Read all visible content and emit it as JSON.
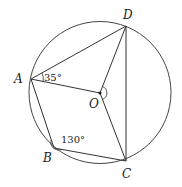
{
  "figure": {
    "type": "circle-geometry",
    "circle": {
      "center": "O",
      "cx": 100,
      "cy": 92.5,
      "r": 71
    },
    "points": [
      {
        "name": "A",
        "x": 31,
        "y": 79,
        "label": "A",
        "lx": 14,
        "ly": 83
      },
      {
        "name": "B",
        "x": 54,
        "y": 148,
        "label": "B",
        "lx": 43,
        "ly": 162
      },
      {
        "name": "C",
        "x": 126,
        "y": 161,
        "label": "C",
        "lx": 122,
        "ly": 178
      },
      {
        "name": "D",
        "x": 126,
        "y": 26,
        "label": "D",
        "lx": 123,
        "ly": 19
      },
      {
        "name": "O",
        "x": 100,
        "y": 93,
        "label": "O",
        "lx": 89,
        "ly": 108
      }
    ],
    "segments": [
      [
        "A",
        "D"
      ],
      [
        "A",
        "O"
      ],
      [
        "A",
        "B"
      ],
      [
        "B",
        "C"
      ],
      [
        "O",
        "D"
      ],
      [
        "O",
        "C"
      ],
      [
        "D",
        "C"
      ]
    ],
    "angles": [
      {
        "vertex": "A",
        "value": "35°",
        "label": "35°"
      },
      {
        "vertex": "B",
        "value": "130°",
        "label": "130°"
      },
      {
        "vertex": "O",
        "value": "",
        "label": ""
      }
    ],
    "stroke_color": "#333333"
  }
}
